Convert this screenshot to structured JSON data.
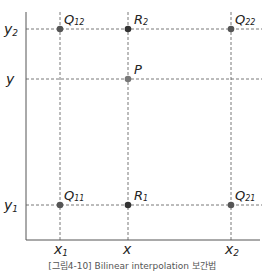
{
  "diagram": {
    "title": "Bilinear interpolation",
    "axis_labels": {
      "y_ticks": [
        {
          "id": "y2",
          "main": "y",
          "sub": "2"
        },
        {
          "id": "y",
          "main": "y",
          "sub": ""
        },
        {
          "id": "y1",
          "main": "y",
          "sub": "1"
        }
      ],
      "x_ticks": [
        {
          "id": "x1",
          "main": "x",
          "sub": "1"
        },
        {
          "id": "x",
          "main": "x",
          "sub": ""
        },
        {
          "id": "x2",
          "main": "x",
          "sub": "2"
        }
      ]
    },
    "points": [
      {
        "id": "Q12",
        "main": "Q",
        "sub": "12",
        "color": "#555555"
      },
      {
        "id": "R2",
        "main": "R",
        "sub": "2",
        "color": "#333333"
      },
      {
        "id": "Q22",
        "main": "Q",
        "sub": "22",
        "color": "#555555"
      },
      {
        "id": "P",
        "main": "P",
        "sub": "",
        "color": "#777777"
      },
      {
        "id": "Q11",
        "main": "Q",
        "sub": "11",
        "color": "#555555"
      },
      {
        "id": "R1",
        "main": "R",
        "sub": "1",
        "color": "#333333"
      },
      {
        "id": "Q21",
        "main": "Q",
        "sub": "21",
        "color": "#555555"
      }
    ]
  },
  "caption": "[그림4-10] Bilinear interpolation 보간법"
}
